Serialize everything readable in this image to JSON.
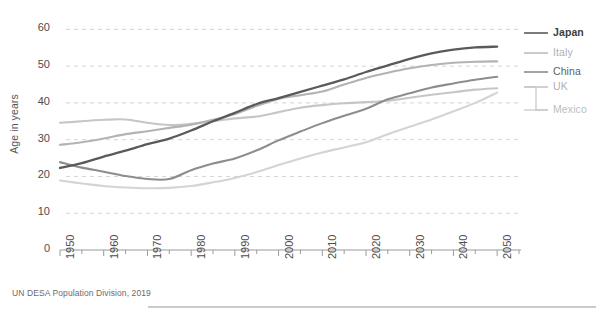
{
  "chart_data": {
    "type": "line",
    "title": "",
    "subtitle": "",
    "xlabel": "",
    "ylabel": "Age in years",
    "xlim": [
      1950,
      2055
    ],
    "ylim": [
      0,
      62
    ],
    "yticks": [
      0,
      10,
      20,
      30,
      40,
      50,
      60
    ],
    "xticks": [
      1950,
      1960,
      1970,
      1980,
      1990,
      2000,
      2010,
      2020,
      2030,
      2040,
      2050
    ],
    "x": [
      1950,
      1955,
      1960,
      1965,
      1970,
      1975,
      1980,
      1985,
      1990,
      1995,
      2000,
      2005,
      2010,
      2015,
      2020,
      2025,
      2030,
      2035,
      2040,
      2045,
      2050
    ],
    "grid": "horizontal-dashed",
    "legend_position": "right",
    "series": [
      {
        "name": "Japan",
        "color": "#5a5a5a",
        "values": [
          22.3,
          23.6,
          25.4,
          27.0,
          28.8,
          30.3,
          32.5,
          35.0,
          37.3,
          39.7,
          41.3,
          43.0,
          44.7,
          46.4,
          48.4,
          50.2,
          52.0,
          53.5,
          54.5,
          55.1,
          55.3
        ]
      },
      {
        "name": "Italy",
        "color": "#b3b3b3",
        "values": [
          28.6,
          29.3,
          30.3,
          31.5,
          32.3,
          33.2,
          34.1,
          35.4,
          37.0,
          39.2,
          41.1,
          42.1,
          43.1,
          45.0,
          46.8,
          48.2,
          49.4,
          50.3,
          50.9,
          51.2,
          51.3
        ]
      },
      {
        "name": "China",
        "color": "#8d8d8d",
        "values": [
          23.9,
          22.4,
          21.3,
          20.1,
          19.3,
          19.3,
          21.7,
          23.5,
          24.9,
          27.1,
          29.8,
          32.2,
          34.5,
          36.5,
          38.4,
          41.0,
          42.6,
          44.2,
          45.3,
          46.3,
          47.1
        ]
      },
      {
        "name": "UK",
        "color": "#c6c6c6",
        "values": [
          34.6,
          35.0,
          35.4,
          35.5,
          34.6,
          34.0,
          34.3,
          35.0,
          35.8,
          36.3,
          37.5,
          38.7,
          39.4,
          39.9,
          40.2,
          40.6,
          41.4,
          42.2,
          42.9,
          43.6,
          44.0
        ]
      },
      {
        "name": "Mexico",
        "color": "#d4d4d4",
        "values": [
          18.9,
          18.1,
          17.4,
          17.0,
          16.8,
          16.9,
          17.4,
          18.4,
          19.6,
          21.2,
          23.1,
          24.9,
          26.5,
          27.9,
          29.3,
          31.5,
          33.5,
          35.5,
          37.7,
          40.0,
          42.8
        ]
      }
    ],
    "source": "UN DESA Population Division, 2019"
  },
  "axes": {
    "ylabel_title": "Age in years",
    "yticks": [
      "60",
      "50",
      "40",
      "30",
      "20",
      "10",
      "0"
    ],
    "xticks": [
      "1950",
      "1960",
      "1970",
      "1980",
      "1990",
      "2000",
      "2010",
      "2020",
      "2030",
      "2040",
      "2050"
    ]
  },
  "legend": {
    "items": [
      {
        "label": "Japan",
        "color": "#5a5a5a",
        "text_color": "#3d3d3d"
      },
      {
        "label": "Italy",
        "color": "#bdbdbd",
        "text_color": "#b0b0b0"
      },
      {
        "label": "China",
        "color": "#8d8d8d",
        "text_color": "#5e5e5e"
      },
      {
        "label": "UK",
        "color": "#c6c6c6",
        "text_color": "#b0b0b0"
      },
      {
        "label": "Mexico",
        "color": "#d4d4d4",
        "text_color": "#bdbdbd"
      }
    ]
  },
  "footer": {
    "source": "UN DESA Population Division, 2019"
  }
}
